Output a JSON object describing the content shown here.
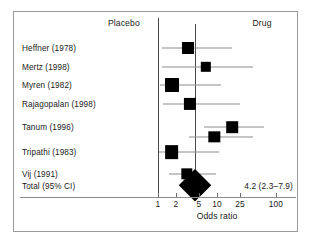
{
  "figure": {
    "kind": "forest-plot",
    "header_left": "Placebo",
    "header_right": "Drug",
    "axis_title": "Odds ratio",
    "total_label": "Total (95% CI)",
    "total_value": "4.2 (2.3–7.9)",
    "marker_color": "#000000",
    "line_color": "#8c8c8c",
    "reference_line_color": "#4a4a4a",
    "frame_color": "#9a9a9a"
  },
  "chart_data": {
    "type": "scatter",
    "subtype": "forest-plot",
    "title": "",
    "xlabel": "Odds ratio",
    "ylabel": "",
    "xscale": "log",
    "xlim": [
      1,
      100
    ],
    "grid": false,
    "legend": false,
    "favours_left": "Placebo",
    "favours_right": "Drug",
    "ticks": [
      1,
      2,
      5,
      10,
      25,
      100
    ],
    "tick_labels": [
      "1",
      "2",
      "5",
      "10",
      "25",
      "100"
    ],
    "reference_lines": [
      {
        "name": "null-effect",
        "value": 1
      },
      {
        "name": "pooled-estimate",
        "value": 4.2
      }
    ],
    "rows": [
      {
        "label": "Heffner (1978)",
        "or": 3.2,
        "ci_low": 1.15,
        "ci_high": 18.0,
        "weight": 0.72
      },
      {
        "label": "Mertz (1998)",
        "or": 6.5,
        "ci_low": 1.15,
        "ci_high": 40.0,
        "weight": 0.48
      },
      {
        "label": "Myren (1982)",
        "or": 1.7,
        "ci_low": 1.1,
        "ci_high": 11.5,
        "weight": 1.0
      },
      {
        "label": "Rajagopalan (1998)",
        "or": 3.5,
        "ci_low": 1.2,
        "ci_high": 25.0,
        "weight": 0.74
      },
      {
        "label": "Tanum (1996)",
        "or": 18.0,
        "ci_low": 6.0,
        "ci_high": 62.0,
        "weight": 0.66
      },
      {
        "label": "",
        "or": 9.0,
        "ci_low": 3.3,
        "ci_high": 40.0,
        "weight": 0.62
      },
      {
        "label": "Tripathi (1983)",
        "or": 1.7,
        "ci_low": 1.05,
        "ci_high": 11.0,
        "weight": 0.96
      },
      {
        "label": "Vij (1991)",
        "or": 3.1,
        "ci_low": 1.55,
        "ci_high": 9.5,
        "weight": 0.62
      }
    ],
    "total": {
      "label": "Total (95% CI)",
      "or": 4.2,
      "ci_low": 2.3,
      "ci_high": 7.9,
      "display": "4.2 (2.3–7.9)"
    }
  }
}
